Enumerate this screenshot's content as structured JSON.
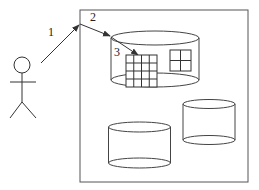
{
  "diagram": {
    "labels": {
      "step1": "1",
      "step2": "2",
      "step3": "3"
    },
    "colors": {
      "stroke": "#333333",
      "background": "#ffffff"
    },
    "elements": {
      "actor": "stick-figure",
      "container": "system-box",
      "databases": [
        "top-cylinder",
        "bottom-left-cylinder",
        "bottom-right-cylinder"
      ],
      "tables": [
        "grid-4x4",
        "grid-2x2"
      ]
    }
  }
}
